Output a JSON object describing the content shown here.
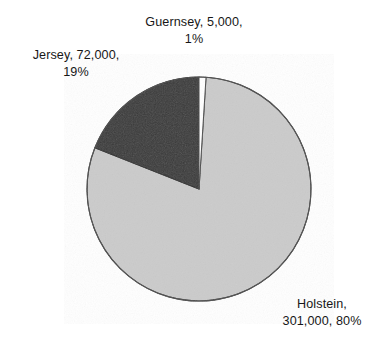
{
  "chart_data": {
    "type": "pie",
    "title": "",
    "subtitle": "",
    "xlabel": "",
    "ylabel": "",
    "legend_position": "none",
    "grid": false,
    "categories": [
      "Guernsey",
      "Jersey",
      "Holstein"
    ],
    "values": [
      5000,
      72000,
      301000
    ],
    "percentages": [
      1,
      19,
      80
    ],
    "total": 378000,
    "slices": [
      {
        "name": "Guernsey",
        "value": 5000,
        "value_text": "5,000",
        "percent": 1,
        "percent_text": "1%",
        "color": "#ffffff",
        "start_angle": 0,
        "end_angle": 3.6
      },
      {
        "name": "Jersey",
        "value": 72000,
        "value_text": "72,000",
        "percent": 19,
        "percent_text": "19%",
        "color": "#3a3a3a",
        "start_angle": 291.6,
        "end_angle": 360
      },
      {
        "name": "Holstein",
        "value": 301000,
        "value_text": "301,000",
        "percent": 80,
        "percent_text": "80%",
        "color": "#cbcbcb",
        "start_angle": 3.6,
        "end_angle": 291.6
      }
    ],
    "annotations": [
      {
        "id": "guernsey",
        "line1": "Guernsey, 5,000,",
        "line2": "1%"
      },
      {
        "id": "jersey",
        "line1": "Jersey, 72,000,",
        "line2": "19%"
      },
      {
        "id": "holstein",
        "line1": "Holstein,",
        "line2": "301,000, 80%"
      }
    ],
    "colors": {
      "guernsey": "#ffffff",
      "jersey": "#3a3a3a",
      "holstein": "#cbcbcb",
      "outline": "#3d3d3d",
      "text": "#171717",
      "background": "#ffffff"
    }
  }
}
